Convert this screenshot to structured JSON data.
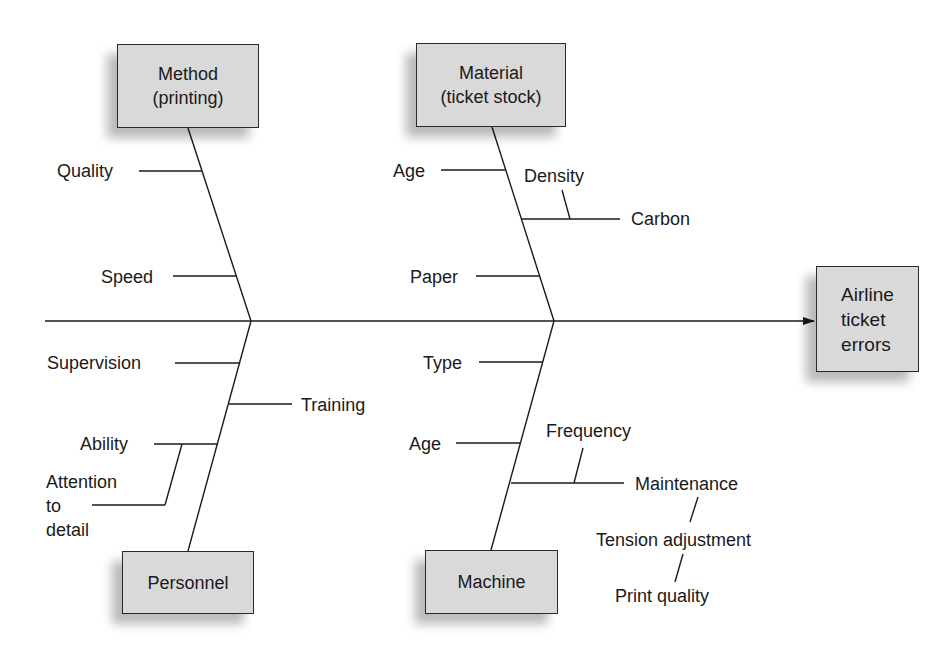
{
  "diagram": {
    "type": "fishbone",
    "effect": {
      "lines": [
        "Airline",
        "ticket",
        "errors"
      ]
    },
    "categories": {
      "method": {
        "lines": [
          "Method",
          "(printing)"
        ],
        "causes": [
          "Quality",
          "Speed"
        ]
      },
      "material": {
        "lines": [
          "Material",
          "(ticket stock)"
        ],
        "causes": [
          "Age",
          "Density",
          "Carbon",
          "Paper"
        ]
      },
      "personnel": {
        "lines": [
          "Personnel"
        ],
        "causes": [
          "Supervision",
          "Training",
          "Ability",
          "Attention to detail"
        ]
      },
      "machine": {
        "lines": [
          "Machine"
        ],
        "causes": [
          "Type",
          "Age",
          "Frequency",
          "Maintenance",
          "Tension adjustment",
          "Print quality"
        ]
      }
    },
    "labels": {
      "quality": "Quality",
      "speed": "Speed",
      "material_age": "Age",
      "density": "Density",
      "carbon": "Carbon",
      "paper": "Paper",
      "supervision": "Supervision",
      "training": "Training",
      "ability": "Ability",
      "attention_lines": [
        "Attention",
        "to",
        "detail"
      ],
      "type": "Type",
      "machine_age": "Age",
      "frequency": "Frequency",
      "maintenance": "Maintenance",
      "tension": "Tension adjustment",
      "print_quality": "Print quality"
    },
    "colors": {
      "box_fill": "#d9d9d9",
      "line": "#1a1a1a",
      "background": "#ffffff"
    }
  }
}
